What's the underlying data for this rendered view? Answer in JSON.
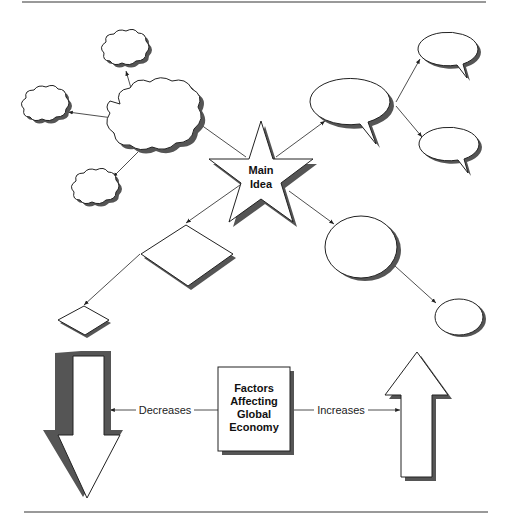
{
  "main_idea": {
    "line1": "Main",
    "line2": "Idea"
  },
  "central_box": {
    "line1": "Factors",
    "line2": "Affecting",
    "line3": "Global",
    "line4": "Economy"
  },
  "left_label": "Decreases",
  "right_label": "Increases",
  "colors": {
    "stroke": "#222222",
    "shadow": "#555555",
    "background": "#ffffff",
    "rule": "#777777"
  }
}
